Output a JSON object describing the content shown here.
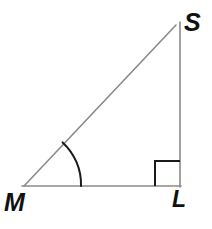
{
  "figure": {
    "kind": "right-triangle-diagram",
    "canvas": {
      "width": 212,
      "height": 229,
      "background": "#ffffff"
    },
    "style": {
      "side_color": "#8a8a8a",
      "side_width": 1.6,
      "marker_color": "#1a1a1a",
      "arc_width": 2.0,
      "square_width": 2.0,
      "label_color": "#111111"
    },
    "vertices": [
      {
        "id": "S",
        "label": "S",
        "x": 176,
        "y": 25,
        "label_x": 184,
        "label_y": 10
      },
      {
        "id": "M",
        "label": "M",
        "x": 24,
        "y": 186,
        "label_x": 4,
        "label_y": 190
      },
      {
        "id": "L",
        "label": "L",
        "x": 180,
        "y": 186,
        "label_x": 172,
        "label_y": 188
      }
    ],
    "sides": [
      {
        "id": "MS",
        "name": "hypotenuse",
        "from": "M",
        "to": "S",
        "x1": 24,
        "y1": 186,
        "x2": 176,
        "y2": 25
      },
      {
        "id": "ML",
        "name": "base",
        "from": "M",
        "to": "L",
        "x1": 22,
        "y1": 186,
        "x2": 181,
        "y2": 186
      },
      {
        "id": "SL",
        "name": "vertical",
        "from": "S",
        "to": "L",
        "x1": 180,
        "y1": 22,
        "x2": 180,
        "y2": 187
      }
    ],
    "markers": [
      {
        "id": "angle-arc-M",
        "type": "angle-arc",
        "at_vertex": "M",
        "radius": 57,
        "path": "M 62.6 142.4 A 57 57 0 0 1 81 186",
        "note": "arc marking the acute angle at vertex M"
      },
      {
        "id": "right-angle-L",
        "type": "right-angle-square",
        "at_vertex": "L",
        "size": 25,
        "path": "M 155 186 L 155 161 L 180 161",
        "note": "square marking the 90 degree angle at vertex L"
      }
    ]
  }
}
